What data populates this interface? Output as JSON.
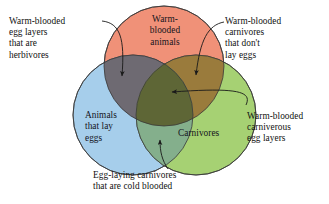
{
  "figure": {
    "type": "venn-diagram-3set",
    "background": "#ffffff"
  },
  "sets": {
    "top": {
      "name": "warm-blooded-animals",
      "label": "Warm-\nblooded\nanimals",
      "color": "#F09178",
      "cx": 164,
      "cy": 66,
      "r": 60
    },
    "left": {
      "name": "animals-that-lay-eggs",
      "label": "Animals\nthat lay\neggs",
      "color": "#A6CEEB",
      "cx": 133,
      "cy": 115,
      "r": 60
    },
    "right": {
      "name": "carnivores",
      "label": "Carnivores",
      "color": "#A6D173",
      "cx": 196,
      "cy": 115,
      "r": 60
    }
  },
  "regions": {
    "top_left_overlap": {
      "name": "warm-blooded-egg-layers",
      "color": "#6E6A72"
    },
    "top_right_overlap": {
      "name": "warm-blooded-carnivores",
      "color": "#9A7B3C"
    },
    "left_right_overlap": {
      "name": "egg-laying-carnivores",
      "color": "#84AF8C"
    },
    "center_overlap": {
      "name": "all-three",
      "color": "#5E6636"
    }
  },
  "callouts": [
    {
      "name": "warm-blooded-egg-layers-herbivores",
      "label": "Warm-blooded\negg layers\nthat are\nherbivores",
      "target_region": "top_left_overlap"
    },
    {
      "name": "warm-blooded-carnivores-no-eggs",
      "label": "Warm-blooded\ncarnivores\nthat don't\nlay eggs",
      "target_region": "top_right_overlap"
    },
    {
      "name": "warm-blooded-carniverous-egg-layers",
      "label": "Warm-blooded\ncarniverous\negg layers",
      "target_region": "center_overlap"
    },
    {
      "name": "egg-laying-carnivores-cold-blooded",
      "label": "Egg-laying carnivores\nthat are cold blooded",
      "target_region": "left_right_overlap"
    }
  ],
  "style": {
    "outline_color": "#3a3a3a",
    "leader_color": "#1a1a1a",
    "text_color": "#111111"
  }
}
